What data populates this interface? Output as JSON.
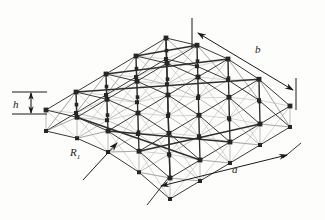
{
  "figure": {
    "kind": "engineering-diagram",
    "caption_bleed": "      ",
    "background_color": "#fdfdfc"
  },
  "labels": {
    "height": "h",
    "span_a": "a",
    "span_b": "b",
    "radius": "R",
    "radius_sub": "1"
  },
  "colors": {
    "chord": "#2f2f2f",
    "chord_light": "#555555",
    "web": "#b9b9b9",
    "web_dark": "#8f8f8f",
    "node": "#262626",
    "dimension": "#1b1b1b",
    "label": "#1b1b1b"
  },
  "geometry": {
    "view": {
      "width": 325,
      "height": 220
    },
    "grid": {
      "nx": 4,
      "ny": 4
    },
    "projection": {
      "origin_x": 168,
      "origin_y": 108,
      "u": [
        31.0,
        17.0
      ],
      "v": [
        -30.0,
        18.0
      ],
      "depth": 21,
      "camber": 13
    },
    "line_widths": {
      "chord_major": 1.35,
      "chord_minor": 0.95,
      "web": 0.6,
      "dimension": 1.0
    },
    "node_size": {
      "top": 2.4,
      "bottom": 2.0
    }
  },
  "dimensions": [
    {
      "id": "dim-h",
      "name": "h",
      "type": "vertical-double-arrow",
      "x": 31,
      "y1": 92,
      "y2": 114,
      "ext_x1": 12,
      "ext_x2": 47
    },
    {
      "id": "dim-a",
      "name": "a",
      "type": "leader-line",
      "x1": 161,
      "y1": 186,
      "x2": 287,
      "y2": 155,
      "ext_x": 147,
      "ext_y": 205
    },
    {
      "id": "dim-b",
      "name": "b",
      "type": "leader-line",
      "x1": 198,
      "y1": 33,
      "x2": 293,
      "y2": 90,
      "ext1_x": 192,
      "ext1_y1": 18,
      "ext1_y2": 48,
      "ext2_x": 296,
      "ext2_y1": 78,
      "ext2_y2": 110
    },
    {
      "id": "dim-r",
      "name": "R1",
      "type": "arrow-leader",
      "x1": 83,
      "y1": 180,
      "x2": 117,
      "y2": 143
    }
  ]
}
